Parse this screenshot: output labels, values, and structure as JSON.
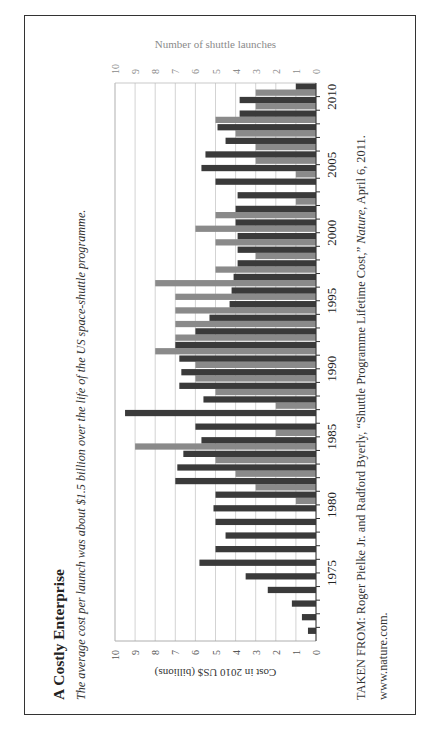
{
  "title": "A Costly Enterprise",
  "subtitle": "The average cost per launch was about $1.5 billion over the life of the US space-shuttle programme.",
  "source": {
    "line1_prefix": "TAKEN FROM: Roger Pielke Jr. and Radford Byerly, “Shuttle Programme Lifetime Cost,” ",
    "line1_journal": "Nature",
    "line1_suffix": ", April 6, 2011.",
    "line2": "www.nature.com."
  },
  "colors": {
    "cost_bar": "#3a3a3a",
    "launch_bar": "#8a8a8a",
    "grid": "#c8c8c8",
    "launch_axis_text": "#8a8a8a",
    "text": "#222222"
  },
  "chart_data": {
    "type": "bar",
    "orientation": "grouped bars, page rotated 90 degrees counter-clockwise",
    "title": "A Costly Enterprise",
    "categories": [
      1971,
      1972,
      1973,
      1974,
      1975,
      1976,
      1977,
      1978,
      1979,
      1980,
      1981,
      1982,
      1983,
      1984,
      1985,
      1986,
      1987,
      1988,
      1989,
      1990,
      1991,
      1992,
      1993,
      1994,
      1995,
      1996,
      1997,
      1998,
      1999,
      2000,
      2001,
      2002,
      2003,
      2004,
      2005,
      2006,
      2007,
      2008,
      2009,
      2010,
      2011
    ],
    "category_tick_labels": [
      "1975",
      "1980",
      "1985",
      "1990",
      "1995",
      "2000",
      "2005",
      "2010"
    ],
    "series": [
      {
        "name": "Number of shuttle launches",
        "axis": "top",
        "values": [
          0,
          0,
          0,
          0,
          0,
          0,
          0,
          0,
          0,
          0,
          1,
          3,
          4,
          5,
          9,
          2,
          0,
          2,
          5,
          6,
          6,
          8,
          7,
          7,
          7,
          7,
          8,
          5,
          3,
          5,
          6,
          5,
          1,
          0,
          1,
          3,
          3,
          4,
          5,
          3,
          3
        ]
      },
      {
        "name": "Cost in 2010 US$ (billions)",
        "axis": "bottom",
        "values": [
          0.4,
          0.7,
          1.2,
          2.4,
          3.5,
          5.8,
          5.0,
          4.5,
          5.0,
          5.1,
          5.0,
          7.0,
          6.9,
          6.6,
          5.7,
          6.0,
          9.5,
          5.6,
          6.8,
          6.7,
          6.8,
          7.0,
          6.0,
          5.3,
          4.3,
          4.2,
          4.1,
          3.9,
          3.9,
          3.9,
          4.0,
          4.0,
          3.9,
          5.0,
          5.7,
          5.5,
          4.5,
          4.9,
          3.8,
          3.8,
          1.0
        ]
      }
    ],
    "cost_axis": {
      "label": "Cost in 2010 US$ (billions)",
      "range": [
        0,
        10
      ],
      "ticks": [
        "0",
        "1",
        "2",
        "3",
        "4",
        "5",
        "6",
        "7",
        "8",
        "9",
        "10"
      ]
    },
    "launch_axis": {
      "label": "Number of shuttle launches",
      "range": [
        0,
        10
      ],
      "ticks": [
        "0",
        "1",
        "2",
        "3",
        "4",
        "5",
        "6",
        "7",
        "8",
        "9",
        "10"
      ]
    },
    "grid": true,
    "legend": "none"
  }
}
